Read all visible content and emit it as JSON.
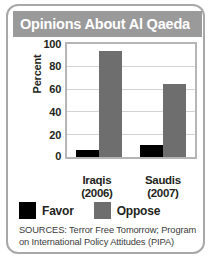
{
  "title": "Opinions About Al Qaeda",
  "legend": [
    {
      "label": "Favor",
      "color": "#000000",
      "swatch_name": "legend-swatch-favor"
    },
    {
      "label": "Oppose",
      "color": "#6e6e6e",
      "swatch_name": "legend-swatch-oppose"
    }
  ],
  "sources": "SOURCES: Terror Free Tomorrow; Program on International Policy Attitudes (PIPA)",
  "colors": {
    "banner": "#9a9a9a",
    "card_border": "#a8a8a8",
    "plot_border": "#b5b5b5",
    "gridline": "#d2d2d2",
    "favor": "#000000",
    "oppose": "#6e6e6e",
    "title_text": "#ffffff"
  },
  "chart_data": {
    "type": "bar",
    "title": "Opinions About Al Qaeda",
    "subtitle": "",
    "xlabel": "",
    "ylabel": "Percent",
    "categories": [
      "Iraqis\n(2006)",
      "Saudis\n(2007)"
    ],
    "category_lines": [
      [
        "Iraqis",
        "(2006)"
      ],
      [
        "Saudis",
        "(2007)"
      ]
    ],
    "series": [
      {
        "name": "Favor",
        "color": "#000000",
        "values": [
          6,
          11
        ]
      },
      {
        "name": "Oppose",
        "color": "#6e6e6e",
        "values": [
          94,
          65
        ]
      }
    ],
    "ylim": [
      0,
      100
    ],
    "yticks": [
      100,
      80,
      60,
      40,
      20,
      0
    ],
    "ytick_labels": [
      "100",
      "80",
      "60",
      "40",
      "20",
      "0"
    ],
    "grid": true,
    "grid_axis": "y",
    "legend_position": "bottom-left",
    "annotations": [
      "SOURCES: Terror Free Tomorrow; Program on International Policy Attitudes (PIPA)"
    ]
  }
}
